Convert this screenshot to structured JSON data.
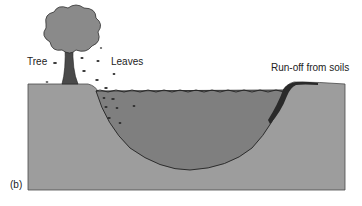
{
  "figure": {
    "panel_label": "(b)",
    "labels": {
      "tree": "Tree",
      "leaves": "Leaves",
      "runoff": "Run-off from soils"
    }
  },
  "colors": {
    "background": "#ffffff",
    "soil": "#9d9d9d",
    "water": "#7f7f7f",
    "outline": "#333333",
    "canopy": "#8a8a8a",
    "trunk": "#4a4a4a",
    "leaf": "#2e2e2e",
    "text": "#222222"
  }
}
